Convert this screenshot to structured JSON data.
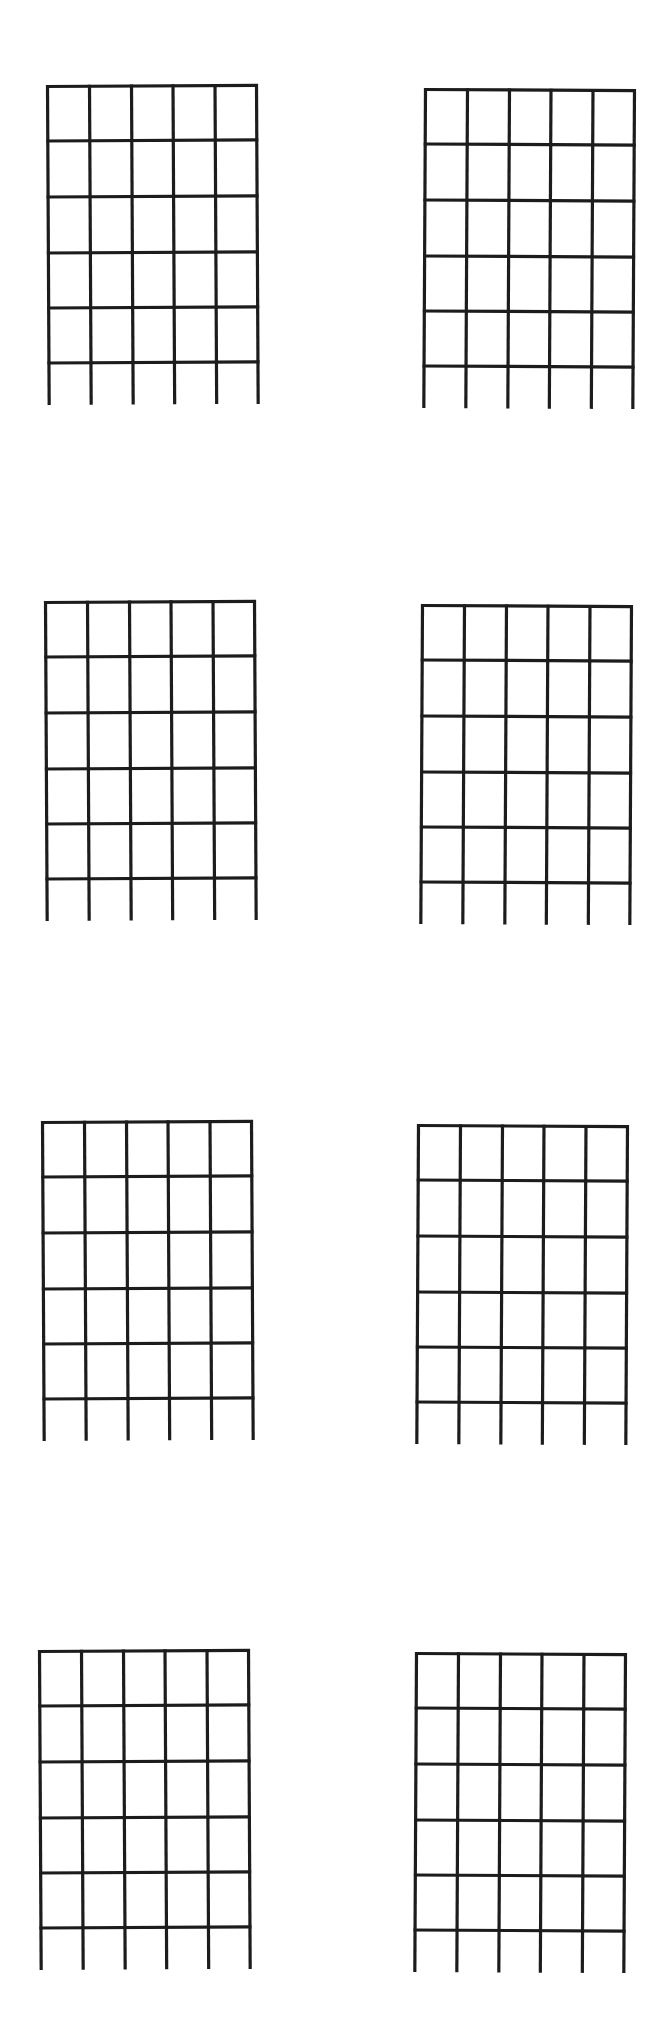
{
  "page": {
    "type": "blank guitar chord chart sheet",
    "background": "#ffffff",
    "line_color": "#1c1c1c",
    "columns": 2,
    "rows": 4,
    "strings_per_box": 6,
    "frets_per_box": 5,
    "open_string_extension": true
  },
  "chord_boxes": [
    {
      "id": "r1c1",
      "row": 1,
      "col": 1,
      "x": 46,
      "y": 85,
      "rotate": -0.3
    },
    {
      "id": "r1c2",
      "row": 1,
      "col": 2,
      "x": 424,
      "y": 88,
      "rotate": 0.3
    },
    {
      "id": "r2c1",
      "row": 2,
      "col": 1,
      "x": 44,
      "y": 601,
      "rotate": -0.3
    },
    {
      "id": "r2c2",
      "row": 2,
      "col": 2,
      "x": 421,
      "y": 604,
      "rotate": 0.3
    },
    {
      "id": "r3c1",
      "row": 3,
      "col": 1,
      "x": 41,
      "y": 1121,
      "rotate": -0.3
    },
    {
      "id": "r3c2",
      "row": 3,
      "col": 2,
      "x": 417,
      "y": 1124,
      "rotate": 0.3
    },
    {
      "id": "r4c1",
      "row": 4,
      "col": 1,
      "x": 38,
      "y": 1650,
      "rotate": -0.3
    },
    {
      "id": "r4c2",
      "row": 4,
      "col": 2,
      "x": 415,
      "y": 1652,
      "rotate": 0.3
    }
  ]
}
